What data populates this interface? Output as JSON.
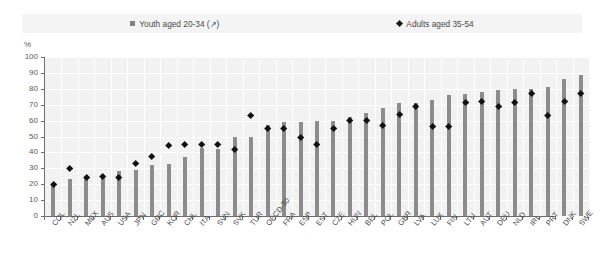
{
  "chart_data": {
    "type": "bar",
    "title": "",
    "subtitle": "",
    "xlabel": "",
    "ylabel": "%",
    "ylim": [
      0,
      100
    ],
    "ytick_step": 10,
    "yticks": [
      0,
      10,
      20,
      30,
      40,
      50,
      60,
      70,
      80,
      90,
      100
    ],
    "grid": true,
    "legend_position": "top",
    "legend": [
      {
        "name": "Youth aged 20-34 (↗)",
        "marker": "square",
        "color": "#8c8c8c"
      },
      {
        "name": "Adults aged 35-54",
        "marker": "diamond",
        "color": "#121212"
      }
    ],
    "categories": [
      "COL",
      "NZL",
      "MEX",
      "AUS",
      "USA",
      "JPN",
      "GRC",
      "KOR",
      "CHL",
      "ITA",
      "SVN",
      "SVK",
      "TUR",
      "OECD-30",
      "FRA",
      "ESP",
      "EST",
      "CZE",
      "HUN",
      "BEL",
      "POL",
      "GBR",
      "LVA",
      "LUX",
      "FIN",
      "LTU",
      "AUT",
      "DEU",
      "NLD",
      "IRL",
      "PRT",
      "DNK",
      "SWE"
    ],
    "series": [
      {
        "name": "Youth aged 20-34 (↗)",
        "marker": "bar",
        "color": "#8c8c8c",
        "values": [
          20,
          23,
          24,
          25,
          28,
          29,
          32,
          33,
          37,
          43,
          42,
          50,
          50,
          57,
          59,
          59,
          60,
          60,
          62,
          65,
          68,
          71,
          71,
          73,
          76,
          77,
          78,
          79,
          80,
          80,
          81,
          86,
          89
        ]
      },
      {
        "name": "Adults aged 35-54",
        "marker": "diamond",
        "color": "#121212",
        "values": [
          20,
          30,
          24,
          25,
          24,
          33,
          37,
          44,
          45,
          45,
          45,
          42,
          63,
          55,
          55,
          49,
          45,
          55,
          60,
          60,
          57,
          64,
          69,
          56,
          56,
          71,
          72,
          69,
          71,
          77,
          63,
          72,
          77
        ]
      }
    ]
  },
  "axis": {
    "y_unit_label": "%"
  }
}
